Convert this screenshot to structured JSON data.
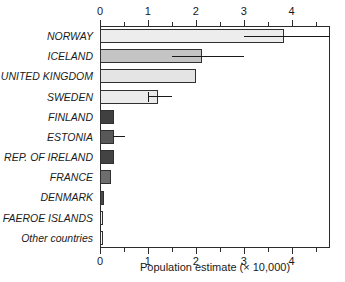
{
  "chart_data": {
    "type": "bar",
    "orientation": "horizontal",
    "title": "",
    "xlabel": "Population estimate (× 10,000)",
    "ylabel": "",
    "xlim": [
      0,
      4.8
    ],
    "xticks": [
      0,
      1,
      2,
      3,
      4
    ],
    "xtick_labels": [
      "0",
      "1",
      "2",
      "3",
      "4"
    ],
    "xminor_ticks": [
      0.5,
      1.5,
      2.5,
      3.5,
      4.5
    ],
    "grid": false,
    "legend": null,
    "axis_positions": [
      "top",
      "bottom"
    ],
    "categories": [
      "NORWAY",
      "ICELAND",
      "UNITED KINGDOM",
      "SWEDEN",
      "FINLAND",
      "ESTONIA",
      "REP. OF IRELAND",
      "FRANCE",
      "DENMARK",
      "FAEROE ISLANDS",
      "Other countries"
    ],
    "values": [
      3.85,
      2.12,
      2.0,
      1.2,
      0.3,
      0.3,
      0.3,
      0.22,
      0.08,
      0.07,
      0.05
    ],
    "bar_colors": [
      "#ededed",
      "#c4c4c4",
      "#e4e4e4",
      "#ebebeb",
      "#404040",
      "#585858",
      "#434343",
      "#6e6e6e",
      "#4a4a4a",
      "#f0f0f0",
      "#fbfbfb"
    ],
    "error_bars": [
      {
        "category": "NORWAY",
        "low": 3.0,
        "high": 4.8,
        "cap_low": false,
        "cap_high": false
      },
      {
        "category": "ICELAND",
        "low": 1.5,
        "high": 3.0,
        "cap_low": false,
        "cap_high": false
      },
      {
        "category": "SWEDEN",
        "low": 1.0,
        "high": 1.5,
        "cap_low": true,
        "cap_high": false
      },
      {
        "category": "ESTONIA",
        "low": 0.28,
        "high": 0.52,
        "cap_low": false,
        "cap_high": false
      }
    ],
    "colors": {
      "axis": "#2b2b2b",
      "text": "#1a1a1a",
      "bar_outline": "#303030",
      "error_bar": "#1a1a1a",
      "background": "#ffffff"
    }
  }
}
